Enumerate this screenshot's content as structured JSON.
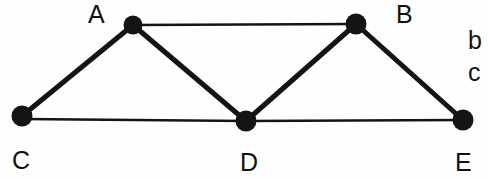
{
  "diagram": {
    "background_color": "#fefefe",
    "stroke_color": "#141414",
    "node_fill_color": "#141414",
    "thin_edge_width": 2,
    "thick_edge_width": 5,
    "nodes": [
      {
        "id": "A",
        "label": "A",
        "cx": 133,
        "cy": 25,
        "r": 9,
        "label_x": 88,
        "label_y": 2
      },
      {
        "id": "B",
        "label": "B",
        "cx": 356,
        "cy": 24,
        "r": 10,
        "label_x": 396,
        "label_y": 2
      },
      {
        "id": "C",
        "label": "C",
        "cx": 22,
        "cy": 116,
        "r": 10,
        "label_x": 12,
        "label_y": 148
      },
      {
        "id": "D",
        "label": "D",
        "cx": 246,
        "cy": 121,
        "r": 10,
        "label_x": 240,
        "label_y": 150
      },
      {
        "id": "E",
        "label": "E",
        "cx": 463,
        "cy": 120,
        "r": 10,
        "label_x": 455,
        "label_y": 150
      }
    ],
    "edges": [
      {
        "id": "A-B",
        "from": "A",
        "to": "B",
        "weight": "thin"
      },
      {
        "id": "C-D",
        "from": "C",
        "to": "D",
        "weight": "thin"
      },
      {
        "id": "D-E",
        "from": "D",
        "to": "E",
        "weight": "thin"
      },
      {
        "id": "C-A",
        "from": "C",
        "to": "A",
        "weight": "thick"
      },
      {
        "id": "A-D",
        "from": "A",
        "to": "D",
        "weight": "thick"
      },
      {
        "id": "D-B",
        "from": "D",
        "to": "B",
        "weight": "thick"
      },
      {
        "id": "B-E",
        "from": "B",
        "to": "E",
        "weight": "thick"
      }
    ],
    "side_labels": [
      {
        "id": "b",
        "label": "b",
        "x": 468,
        "y": 28
      },
      {
        "id": "c",
        "label": "c",
        "x": 468,
        "y": 60
      }
    ]
  }
}
